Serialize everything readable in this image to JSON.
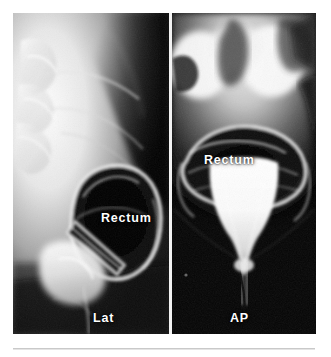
{
  "figure": {
    "kind": "radiograph-pair",
    "modality": "defecography",
    "background_color": "#ffffff",
    "film_background_color": "#000000",
    "divider_color": "#f2f2f2",
    "label_color": "#ffffff",
    "rule_color": "#c9c9c9",
    "panels": [
      {
        "id": "lat",
        "view_label": "Lat",
        "structure_label": "Rectum",
        "description": "lateral projection"
      },
      {
        "id": "ap",
        "view_label": "AP",
        "structure_label": "Rectum",
        "description": "anteroposterior projection"
      }
    ]
  }
}
